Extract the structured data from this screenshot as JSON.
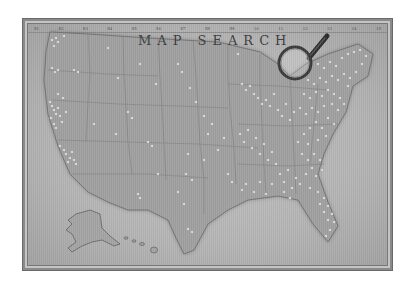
{
  "image": {
    "description": "Vintage-style grayscale map of the United States with many white push-pins, titled MAP SEARCH, with a magnifying glass over the Great Lakes region",
    "title": "MAP SEARCH",
    "top_scale_labels": [
      "81",
      "82",
      "83",
      "84",
      "85",
      "86",
      "87",
      "88",
      "89",
      "10",
      "11",
      "12",
      "13",
      "14",
      "15"
    ],
    "regions_shown": [
      "Contiguous United States",
      "Alaska",
      "Hawaii"
    ],
    "objects": [
      "push pins",
      "magnifying glass"
    ],
    "colors": {
      "background": "#ffffff",
      "paper": "#b8b8b8",
      "land": "#9a9a9a",
      "pins": "#f2f2f2",
      "title": "#3d3d3d"
    }
  }
}
